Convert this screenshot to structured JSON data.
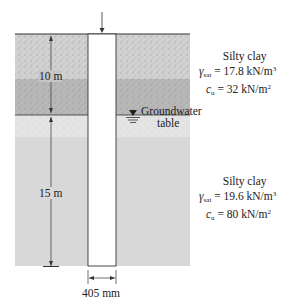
{
  "figure": {
    "load_arrow": "downward load arrow on pile head",
    "layer1": {
      "thickness_label": "10 m",
      "soil": "Silty clay",
      "gamma_sym": "γ",
      "gamma_sub": "sat",
      "gamma_val": "= 17.8 kN/m",
      "gamma_exp": "3",
      "cu_sym": "c",
      "cu_sub": "u",
      "cu_val": "= 32 kN/m",
      "cu_exp": "2"
    },
    "water_table": {
      "line1": "Groundwater",
      "line2": "table"
    },
    "layer2": {
      "thickness_label": "15 m",
      "soil": "Silty clay",
      "gamma_sym": "γ",
      "gamma_sub": "sat",
      "gamma_val": "= 19.6 kN/m",
      "gamma_exp": "3",
      "cu_sym": "c",
      "cu_sub": "u",
      "cu_val": "= 80 kN/m",
      "cu_exp": "2"
    },
    "pile_diameter_label": "405 mm",
    "colors": {
      "layer1_upper": "#cfcfcf",
      "layer1_lower": "#b9b9b9",
      "layer2_upper": "#e2e2e2",
      "layer2_lower": "#d6d6d6",
      "pile": "#ffffff",
      "line": "#333333"
    }
  }
}
